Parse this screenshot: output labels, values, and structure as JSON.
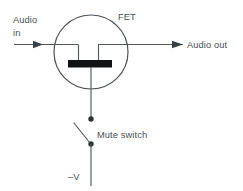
{
  "diagram": {
    "type": "schematic",
    "colors": {
      "background": "#ffffff",
      "wire": "#555a5e",
      "envelope": "#4c5156",
      "channel": "#111315",
      "text": "#4a4f53",
      "node": "#2e3235"
    },
    "labels": {
      "audio_in_line1": "Audio",
      "audio_in_line2": "in",
      "device": "FET",
      "audio_out": "Audio out",
      "mute_switch": "Mute switch",
      "supply": "–V"
    },
    "components": [
      {
        "name": "fet-envelope",
        "shape": "circle",
        "cx": 91,
        "cy": 52,
        "r": 37
      },
      {
        "name": "fet-channel-bar",
        "shape": "rect",
        "x": 68,
        "y": 60,
        "width": 44,
        "height": 7
      },
      {
        "name": "source-terminal",
        "x": 78,
        "y": 44
      },
      {
        "name": "drain-terminal",
        "x": 98,
        "y": 44
      },
      {
        "name": "gate-terminal",
        "x": 91,
        "y": 67
      },
      {
        "name": "switch-node-upper",
        "cx": 91,
        "cy": 119,
        "r": 2.6
      },
      {
        "name": "switch-node-lower",
        "cx": 91,
        "cy": 144,
        "r": 2.6
      }
    ],
    "signal_flow": [
      {
        "name": "audio-in-arrow",
        "direction": "right",
        "tip_x": 43,
        "y": 44
      },
      {
        "name": "audio-out-arrow",
        "direction": "right",
        "tip_x": 183,
        "y": 44
      }
    ]
  }
}
